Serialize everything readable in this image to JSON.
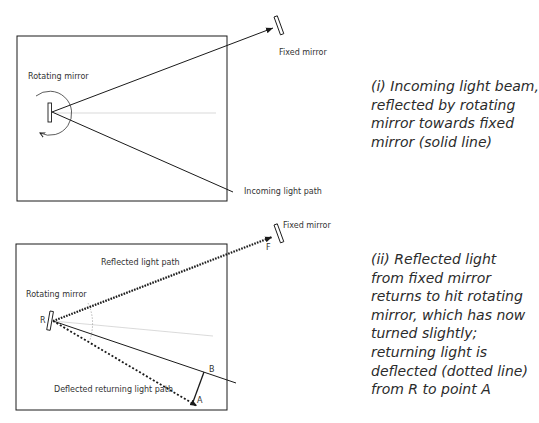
{
  "panel1": {
    "labels": {
      "rotating_mirror": "Rotating mirror",
      "fixed_mirror": "Fixed mirror",
      "incoming_path": "Incoming light path"
    },
    "caption_lines": [
      "(i) Incoming light beam,",
      "reflected by rotating",
      "mirror towards fixed",
      "mirror (solid line)"
    ]
  },
  "panel2": {
    "labels": {
      "rotating_mirror": "Rotating mirror",
      "fixed_mirror": "Fixed mirror",
      "reflected_path": "Reflected light path",
      "deflected_path": "Deflected returning light path",
      "point_r": "R",
      "point_f": "F",
      "point_b": "B",
      "point_a": "A"
    },
    "caption_lines": [
      "(ii) Reflected light",
      "from fixed mirror",
      "returns to hit rotating",
      "mirror, which has now",
      "turned slightly;",
      "returning light is",
      "deflected (dotted line)",
      "from R to point A"
    ]
  },
  "colors": {
    "line": "#1a1a1a",
    "guide": "#c8c8c8",
    "text": "#333333"
  }
}
